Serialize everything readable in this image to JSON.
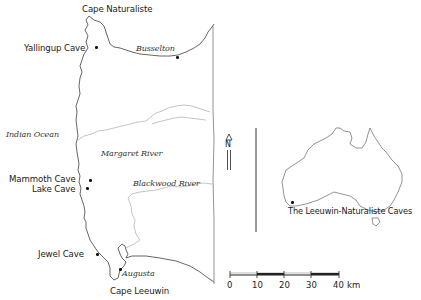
{
  "map": {
    "type": "location-map",
    "region": "Leeuwin-Naturaliste region, south-west Western Australia",
    "capes": [
      {
        "label": "Cape Naturaliste"
      },
      {
        "label": "Cape Leeuwin"
      }
    ],
    "caves": [
      {
        "label": "Yallingup Cave"
      },
      {
        "label": "Mammoth Cave"
      },
      {
        "label": "Lake Cave"
      },
      {
        "label": "Jewel Cave"
      }
    ],
    "towns": [
      {
        "label": "Busselton"
      },
      {
        "label": "Augusta"
      }
    ],
    "rivers": [
      {
        "label": "Margaret River"
      },
      {
        "label": "Blackwood River"
      }
    ],
    "water_bodies": [
      {
        "label": "Indian Ocean"
      }
    ],
    "north_arrow": {
      "label": "N"
    },
    "scale_bar": {
      "ticks": [
        "0",
        "10",
        "20",
        "30",
        "40"
      ],
      "unit": "km"
    },
    "inset": {
      "label": "The Leeuwin-Naturaliste Caves",
      "depicts": "Australia outline with location marker in south-west"
    },
    "colors": {
      "coastline": "#555555",
      "rivers": "#aaaaaa",
      "labels": "#1a1a1a",
      "background": "#ffffff"
    }
  }
}
